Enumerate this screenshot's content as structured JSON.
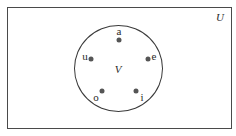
{
  "diagram": {
    "type": "venn",
    "universe": {
      "label": "U",
      "label_pos": [
        220,
        17
      ]
    },
    "set": {
      "label": "V",
      "label_pos": [
        118,
        69
      ],
      "center": [
        118.5,
        68.5
      ],
      "radius": 44
    },
    "elements": [
      {
        "label": "a",
        "dot": [
          119,
          40
        ],
        "label_pos": [
          119,
          31
        ]
      },
      {
        "label": "e",
        "dot": [
          148,
          59
        ],
        "label_pos": [
          154,
          56
        ]
      },
      {
        "label": "i",
        "dot": [
          136,
          91
        ],
        "label_pos": [
          142,
          97
        ]
      },
      {
        "label": "o",
        "dot": [
          102,
          91
        ],
        "label_pos": [
          96,
          97
        ]
      },
      {
        "label": "u",
        "dot": [
          91,
          59
        ],
        "label_pos": [
          85,
          56
        ]
      }
    ],
    "colors": {
      "line": "#3a3a3a",
      "dot": "#555555",
      "text": "#2a2a2a",
      "background": "#ffffff"
    }
  }
}
